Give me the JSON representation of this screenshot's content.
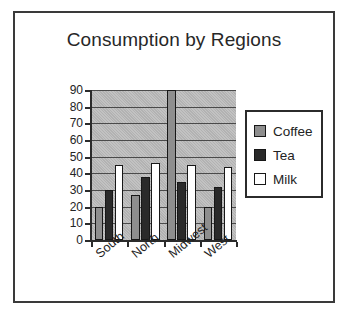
{
  "chart_data": {
    "type": "bar",
    "title": "Consumption by Regions",
    "xlabel": "",
    "ylabel": "",
    "categories": [
      "South",
      "North",
      "Midwest",
      "West"
    ],
    "series": [
      {
        "name": "Coffee",
        "color": "#8e8e8e",
        "values": [
          20,
          27,
          90,
          20
        ]
      },
      {
        "name": "Tea",
        "color": "#2a2a2a",
        "values": [
          30,
          38,
          35,
          32
        ]
      },
      {
        "name": "Milk",
        "color": "#ffffff",
        "values": [
          45,
          46,
          45,
          44
        ]
      }
    ],
    "ylim": [
      0,
      90
    ],
    "ytick_labels": [
      "90",
      "80",
      "70",
      "60",
      "50",
      "40",
      "30",
      "20",
      "10",
      "0"
    ],
    "ytick_values": [
      90,
      80,
      70,
      60,
      50,
      40,
      30,
      20,
      10,
      0
    ],
    "grid": true,
    "legend_position": "right",
    "plot_background": "#bcbcbc",
    "frame_border_color": "#3a3a3a"
  },
  "legend": {
    "items": [
      {
        "label": "Coffee",
        "swatch": "coffee"
      },
      {
        "label": "Tea",
        "swatch": "tea"
      },
      {
        "label": "Milk",
        "swatch": "milk"
      }
    ]
  }
}
